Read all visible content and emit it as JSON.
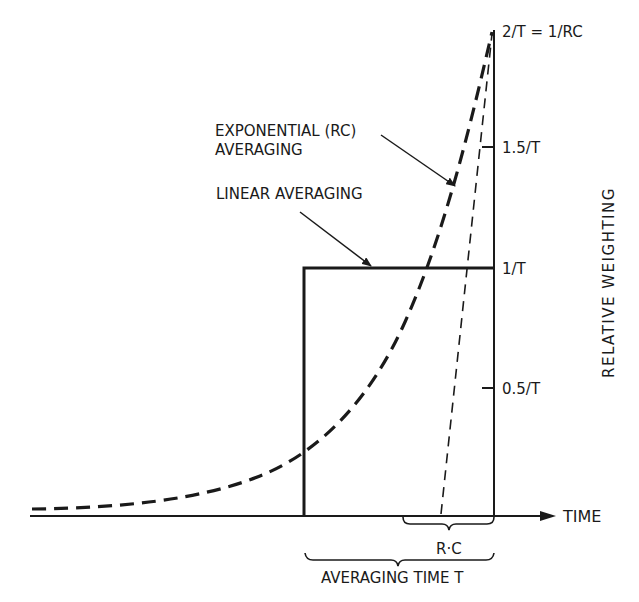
{
  "diagram": {
    "title": "",
    "labels": {
      "exponential_line1": "EXPONENTIAL (RC)",
      "exponential_line2": "AVERAGING",
      "linear": "LINEAR AVERAGING",
      "time_axis": "TIME",
      "y_axis": "RELATIVE WEIGHTING",
      "rc_brace": "R·C",
      "averaging_time_brace": "AVERAGING TIME T"
    },
    "y_ticks": [
      {
        "label": "2/T = 1/RC",
        "value": 2.0
      },
      {
        "label": "1.5/T",
        "value": 1.5
      },
      {
        "label": "1/T",
        "value": 1.0
      },
      {
        "label": "0.5/T",
        "value": 0.5
      }
    ],
    "colors": {
      "ink": "#1a1a1a",
      "background": "#ffffff"
    }
  }
}
